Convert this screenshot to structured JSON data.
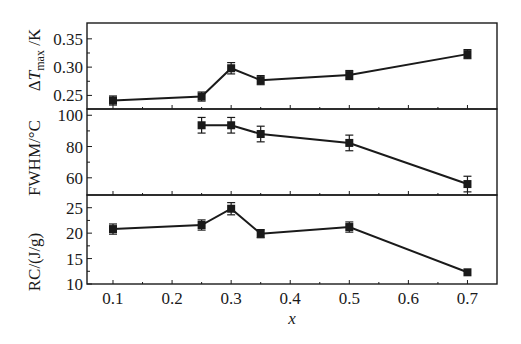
{
  "chart_data": [
    {
      "type": "line",
      "panel": "top",
      "ylabel": "ΔT_max /K",
      "ylabel_parts": {
        "delta": "Δ",
        "var": "T",
        "sub": "max",
        "unit": " /K"
      },
      "ylim": [
        0.226,
        0.378
      ],
      "yticks": [
        0.25,
        0.3,
        0.35
      ],
      "ytick_labels": [
        "0.25",
        "0.30",
        "0.35"
      ],
      "x": [
        0.1,
        0.25,
        0.3,
        0.35,
        0.5,
        0.7
      ],
      "values": [
        0.241,
        0.248,
        0.298,
        0.277,
        0.286,
        0.323
      ],
      "errors": [
        0.008,
        0.008,
        0.01,
        0.008,
        0.008,
        0.008
      ],
      "marker": "square"
    },
    {
      "type": "line",
      "panel": "middle",
      "ylabel": "FWHM/°C",
      "ylim": [
        49,
        104
      ],
      "yticks": [
        60,
        80,
        100
      ],
      "ytick_labels": [
        "60",
        "80",
        "100"
      ],
      "x": [
        0.25,
        0.3,
        0.35,
        0.5,
        0.7
      ],
      "values": [
        93.6,
        93.6,
        88,
        82.3,
        56
      ],
      "errors": [
        5,
        5,
        5,
        5,
        5
      ],
      "marker": "square"
    },
    {
      "type": "line",
      "panel": "bottom",
      "ylabel": "RC/(J/g)",
      "ylim": [
        10,
        27.5
      ],
      "yticks": [
        10,
        15,
        20,
        25
      ],
      "ytick_labels": [
        "10",
        "15",
        "20",
        "25"
      ],
      "x": [
        0.1,
        0.25,
        0.3,
        0.35,
        0.5,
        0.7
      ],
      "values": [
        20.8,
        21.6,
        24.8,
        19.9,
        21.2,
        12.3
      ],
      "errors": [
        1.0,
        1.0,
        1.2,
        0.8,
        1.0,
        0
      ],
      "marker": "square"
    }
  ],
  "xaxis": {
    "label": "x",
    "xlim": [
      0.056,
      0.75
    ],
    "ticks": [
      0.1,
      0.2,
      0.3,
      0.4,
      0.5,
      0.6,
      0.7
    ],
    "tick_labels": [
      "0.1",
      "0.2",
      "0.3",
      "0.4",
      "0.5",
      "0.6",
      "0.7"
    ],
    "minor_ticks": [
      0.15,
      0.25,
      0.35,
      0.45,
      0.55,
      0.65
    ]
  },
  "style": {
    "line_color": "#1a1a1a",
    "background": "#ffffff"
  }
}
